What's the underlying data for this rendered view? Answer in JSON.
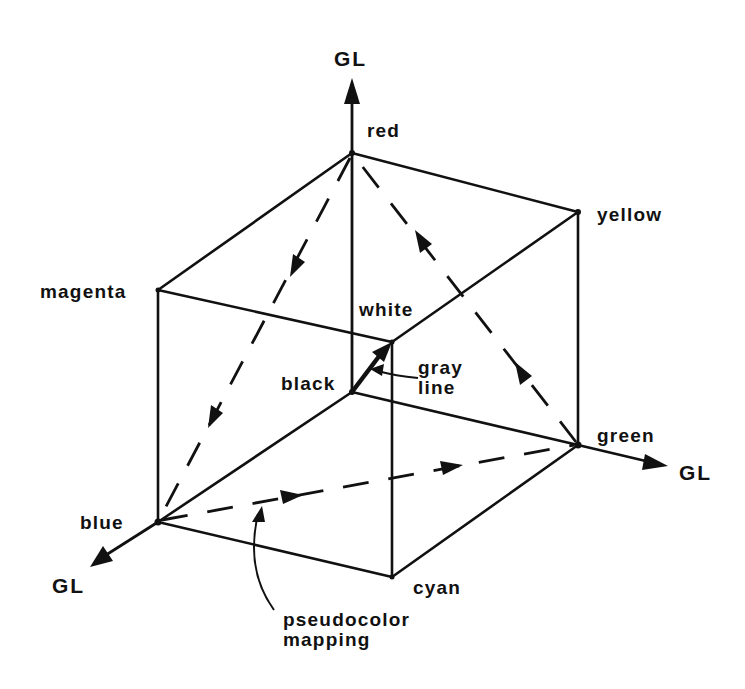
{
  "figure": {
    "colors": {
      "ink": "#111111",
      "background": "#ffffff"
    }
  },
  "axes": {
    "red_axis_label": "GL",
    "green_axis_label": "GL",
    "blue_axis_label": "GL"
  },
  "vertices": {
    "red": "red",
    "yellow": "yellow",
    "magenta": "magenta",
    "white": "white",
    "black": "black",
    "green": "green",
    "blue": "blue",
    "cyan": "cyan"
  },
  "annotations": {
    "gray_line": {
      "line1": "gray",
      "line2": "line"
    },
    "pseudocolor": {
      "line1": "pseudocolor",
      "line2": "mapping"
    }
  }
}
